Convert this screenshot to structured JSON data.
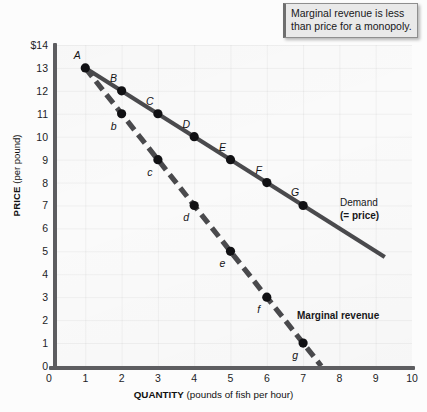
{
  "callout": {
    "text": "Marginal revenue is less than price for a monopoly."
  },
  "labels": {
    "demand_line1": "Demand",
    "demand_line2": "(= price)",
    "marginal_revenue": "Marginal revenue",
    "ytitle_bold": "PRICE",
    "ytitle_rest": " (per pound)",
    "xtitle_bold": "QUANTITY",
    "xtitle_rest": " (pounds of fish per hour)"
  },
  "chart_data": {
    "type": "line",
    "title": "",
    "subtitle": "",
    "xlabel": "QUANTITY (pounds of fish per hour)",
    "ylabel": "PRICE (per pound)",
    "xlim": [
      0,
      10
    ],
    "ylim": [
      0,
      14
    ],
    "xticks": [
      "0",
      "1",
      "2",
      "3",
      "4",
      "5",
      "6",
      "7",
      "8",
      "9",
      "10"
    ],
    "yticks": [
      "$14",
      "13",
      "12",
      "11",
      "10",
      "9",
      "8",
      "7",
      "6",
      "5",
      "4",
      "3",
      "2",
      "1",
      "0"
    ],
    "grid": true,
    "legend_position": "inline-annotation",
    "series": [
      {
        "name": "Demand (= price)",
        "style": "solid",
        "color": "#4a4a4d",
        "x": [
          1,
          2,
          3,
          4,
          5,
          6,
          7
        ],
        "values": [
          13,
          12,
          11,
          10,
          9,
          8,
          7
        ],
        "point_labels": [
          "A",
          "B",
          "C",
          "D",
          "E",
          "F",
          "G"
        ],
        "line_extent_x": [
          1,
          9.25
        ],
        "line_extent_y": [
          13,
          4.75
        ]
      },
      {
        "name": "Marginal revenue",
        "style": "dashed",
        "color": "#4a4a4d",
        "x": [
          2,
          3,
          4,
          5,
          6,
          7
        ],
        "values": [
          11,
          9,
          7,
          5,
          3,
          1
        ],
        "point_labels": [
          "b",
          "c",
          "d",
          "e",
          "f",
          "g"
        ],
        "line_extent_x": [
          1,
          7.5
        ],
        "line_extent_y": [
          13,
          0
        ]
      }
    ],
    "annotations": [
      {
        "text": "Marginal revenue is less than price for a monopoly.",
        "kind": "callout"
      },
      {
        "text": "Demand (= price)",
        "kind": "series-label"
      },
      {
        "text": "Marginal revenue",
        "kind": "series-label"
      }
    ]
  }
}
